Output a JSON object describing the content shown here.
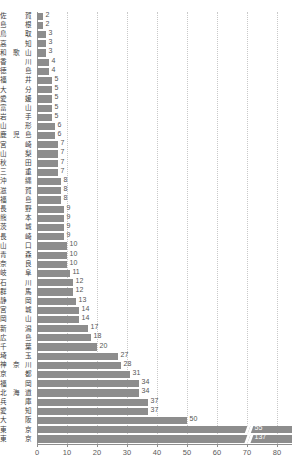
{
  "chart_data": {
    "type": "bar",
    "orientation": "horizontal",
    "title": "",
    "subtitle": "",
    "xlabel": "",
    "ylabel": "",
    "xlim": [
      0,
      85
    ],
    "xticks": [
      0,
      10,
      20,
      30,
      40,
      50,
      60,
      70,
      80
    ],
    "xtick_labels": [
      "0",
      "10",
      "20",
      "30",
      "40",
      "50",
      "60",
      "70",
      "80"
    ],
    "grid": true,
    "grid_axis": "x",
    "legend": false,
    "legend_position": "none",
    "bar_color": "#8d8d8d",
    "data_labels": true,
    "axis_break": {
      "present": true,
      "category": "東京",
      "displayed_value": 137,
      "note": "bar truncated with break marker near 70"
    },
    "categories": [
      "佐賀",
      "島根",
      "鳥取",
      "高知",
      "和歌山",
      "香川",
      "徳島",
      "福井",
      "大分",
      "愛媛",
      "富山",
      "岩手",
      "山形",
      "鹿児島",
      "宮崎",
      "山梨",
      "秋田",
      "三重",
      "沖縄",
      "滋賀",
      "福島",
      "長野",
      "熊本",
      "茨城",
      "長崎",
      "山口",
      "青森",
      "奈良",
      "岐阜",
      "石川",
      "群馬",
      "静岡",
      "宮城",
      "岡山",
      "新潟",
      "広島",
      "千葉",
      "埼玉",
      "神奈川",
      "京都",
      "福岡",
      "北海道",
      "兵庫",
      "愛知",
      "大阪",
      "東京"
    ],
    "values": [
      2,
      2,
      3,
      3,
      3,
      4,
      4,
      5,
      5,
      5,
      5,
      5,
      6,
      6,
      7,
      7,
      7,
      7,
      8,
      8,
      8,
      9,
      9,
      9,
      9,
      10,
      10,
      10,
      11,
      12,
      12,
      13,
      14,
      14,
      17,
      18,
      20,
      27,
      28,
      31,
      34,
      34,
      37,
      37,
      50,
      55
    ],
    "extra_row": {
      "category": "東京",
      "value": 137
    }
  }
}
